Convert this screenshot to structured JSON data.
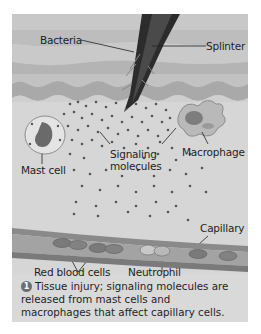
{
  "figure": {
    "labels": {
      "bacteria": "Bacteria",
      "splinter": "Splinter",
      "mast_cell": "Mast cell",
      "signaling_1": "Signaling",
      "signaling_2": "molecules",
      "macrophage": "Macrophage",
      "capillary": "Capillary",
      "red_blood_cells": "Red blood cells",
      "neutrophil": "Neutrophil"
    },
    "caption": {
      "step_number": "1",
      "text": "Tissue injury; signaling molecules are released from mast cells and macrophages that affect capillary cells."
    },
    "colors": {
      "background": "#d9d9d9",
      "skin_layer": "#b8b8b8",
      "splinter": "#2a2a2a",
      "capillary_wall": "#8a8a8a",
      "step_badge": "#6e6e6e"
    }
  }
}
